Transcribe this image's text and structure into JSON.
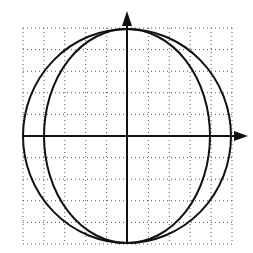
{
  "diagram": {
    "colors": {
      "stroke": "#111111",
      "grid": "#555555",
      "background": "#ffffff"
    },
    "grid": {
      "x0": 23,
      "y0": 28,
      "x1": 232,
      "y1": 244,
      "cols": 10,
      "rows": 10
    },
    "center": {
      "x": 127,
      "y": 136
    },
    "outer_circle": {
      "rx": 104,
      "ry": 107
    },
    "inner_ellipse": {
      "rx": 83,
      "ry": 107
    },
    "x_axis": {
      "x_start": 23,
      "x_end": 248,
      "y": 136,
      "arrow": "right"
    },
    "y_axis": {
      "y_start": 243,
      "y_end": 11,
      "x": 127,
      "arrow": "up"
    }
  }
}
